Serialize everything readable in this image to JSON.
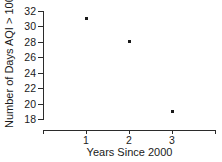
{
  "chart_data": {
    "type": "scatter",
    "title": "",
    "subtitle": "",
    "xlabel": "Years Since 2000",
    "ylabel": "Number of Days AQI > 100",
    "x": [
      1,
      2,
      3
    ],
    "values": [
      31,
      28,
      19
    ],
    "points": [
      {
        "x": 1,
        "y": 31
      },
      {
        "x": 2,
        "y": 28
      },
      {
        "x": 3,
        "y": 19
      }
    ],
    "xlim": [
      0.0,
      4.0
    ],
    "ylim": [
      18,
      32
    ],
    "xticks": [
      1,
      2,
      3
    ],
    "xtick_labels": [
      "1",
      "2",
      "3"
    ],
    "yticks": [
      18,
      20,
      22,
      24,
      26,
      28,
      30,
      32
    ],
    "ytick_labels": [
      "18",
      "20",
      "22",
      "24",
      "26",
      "28",
      "30",
      "32"
    ],
    "grid": false,
    "legend": null,
    "legend_position": "none",
    "marker": "square",
    "marker_color": "#1a1a1a",
    "axis_color": "#2b2b2b",
    "background_color": "#ffffff",
    "annotations": []
  }
}
